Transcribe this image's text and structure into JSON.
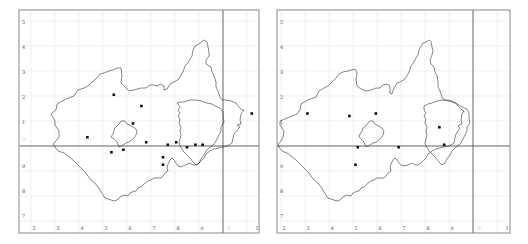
{
  "colors": {
    "background": "#ffffff",
    "frame": "#8a8a8a",
    "grid": "#e6e6e6",
    "major_grid": "#444444",
    "outline": "#333333",
    "dot": "#111111",
    "label": "#555555",
    "faint_label": "#cccccc"
  },
  "grid_labels": {
    "columns": [
      "2",
      "3",
      "4",
      "5",
      "6",
      "7",
      "8",
      "9",
      "0",
      "1"
    ],
    "rows": [
      "5",
      "4",
      "3",
      "2",
      "1",
      "0",
      "9",
      "8",
      "7"
    ],
    "faint_column": "0",
    "faint_row": "0"
  },
  "maps": [
    {
      "name": "left-map",
      "records": [
        {
          "col": 5.45,
          "row": 2.05
        },
        {
          "col": 6.6,
          "row": 1.6
        },
        {
          "col": 6.25,
          "row": 0.9
        },
        {
          "col": 4.35,
          "row": 0.35
        },
        {
          "col": 6.8,
          "row": 0.15
        },
        {
          "col": 7.7,
          "row": 0.05
        },
        {
          "col": 8.05,
          "row": 0.15
        },
        {
          "col": 8.5,
          "row": -0.05
        },
        {
          "col": 8.85,
          "row": 0.05
        },
        {
          "col": 9.15,
          "row": 0.05
        },
        {
          "col": 5.35,
          "row": -0.25
        },
        {
          "col": 5.85,
          "row": -0.15
        },
        {
          "col": 7.5,
          "row": -0.45
        },
        {
          "col": 7.5,
          "row": -0.75
        },
        {
          "col": 11.2,
          "row": 1.3
        }
      ]
    },
    {
      "name": "right-map",
      "records": [
        {
          "col": 3.1,
          "row": 1.3
        },
        {
          "col": 4.85,
          "row": 1.2
        },
        {
          "col": 5.95,
          "row": 1.3
        },
        {
          "col": 8.6,
          "row": 0.75
        },
        {
          "col": 5.2,
          "row": -0.05
        },
        {
          "col": 6.9,
          "row": -0.05
        },
        {
          "col": 8.8,
          "row": 0.05
        },
        {
          "col": 5.1,
          "row": -0.75
        }
      ]
    }
  ]
}
